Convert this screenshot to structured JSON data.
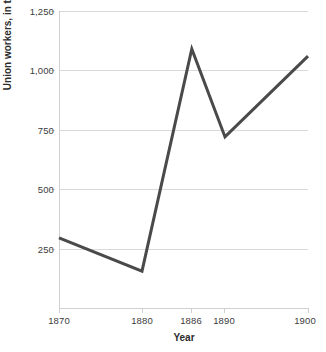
{
  "chart_data": {
    "type": "line",
    "title": "",
    "xlabel": "Year",
    "ylabel": "Union workers, in thousands",
    "x": [
      1870,
      1880,
      1886,
      1890,
      1900
    ],
    "values": [
      295,
      155,
      1090,
      720,
      1060
    ],
    "categories": [
      "1870",
      "1880",
      "1886",
      "1890",
      "1900"
    ],
    "xtick_labels": [
      "1870",
      "1880",
      "1886",
      "1890",
      "1900"
    ],
    "ytick_labels": [
      "250",
      "500",
      "750",
      "1,000",
      "1,250"
    ],
    "ytick_values": [
      250,
      500,
      750,
      1000,
      1250
    ],
    "xlim": [
      1870,
      1900
    ],
    "ylim": [
      0,
      1250
    ],
    "grid": true,
    "legend": false,
    "series": [
      {
        "name": "Union workers",
        "values": [
          295,
          155,
          1090,
          720,
          1060
        ],
        "color": "#4a4a4a"
      }
    ],
    "line_color": "#4a4a4a",
    "line_width": 3,
    "grid_color": "#d9d9d9",
    "background": "#ffffff"
  }
}
